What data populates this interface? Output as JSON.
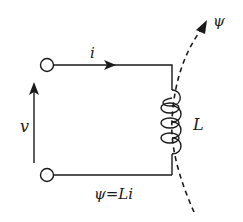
{
  "diagram": {
    "type": "inductor circuit",
    "labels": {
      "current": "i",
      "voltage": "v",
      "inductance": "L",
      "flux": "ψ",
      "relation": "ψ=Li"
    },
    "colors": {
      "stroke": "#1a1a1a",
      "background": "#ffffff"
    }
  }
}
